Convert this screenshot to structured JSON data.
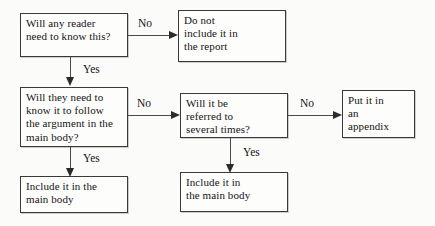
{
  "diagram": {
    "background_color": "#fbfbfa",
    "border_color": "#3a3a3a",
    "text_color": "#141414",
    "nodes": [
      {
        "id": "q1",
        "text": "Will any reader\nneed to know this?",
        "type": "decision"
      },
      {
        "id": "a1",
        "text": "Do not\ninclude it in\nthe report",
        "type": "outcome"
      },
      {
        "id": "q2",
        "text": "Will they need to\nknow it to follow\nthe argument in the\nmain body?",
        "type": "decision"
      },
      {
        "id": "q3",
        "text": "Will it be\nreferred to\nseveral times?",
        "type": "decision"
      },
      {
        "id": "a2",
        "text": "Put it in\nan\nappendix",
        "type": "outcome"
      },
      {
        "id": "a3",
        "text": "Include it in the\nmain body",
        "type": "outcome"
      },
      {
        "id": "a4",
        "text": "Include it in\nthe main body",
        "type": "outcome"
      }
    ],
    "edges": [
      {
        "id": "e1",
        "from": "q1",
        "to": "a1",
        "label": "No"
      },
      {
        "id": "e2",
        "from": "q1",
        "to": "q2",
        "label": "Yes"
      },
      {
        "id": "e3",
        "from": "q2",
        "to": "q3",
        "label": "No"
      },
      {
        "id": "e4",
        "from": "q2",
        "to": "a3",
        "label": "Yes"
      },
      {
        "id": "e5",
        "from": "q3",
        "to": "a2",
        "label": "No"
      },
      {
        "id": "e6",
        "from": "q3",
        "to": "a4",
        "label": "Yes"
      }
    ]
  }
}
